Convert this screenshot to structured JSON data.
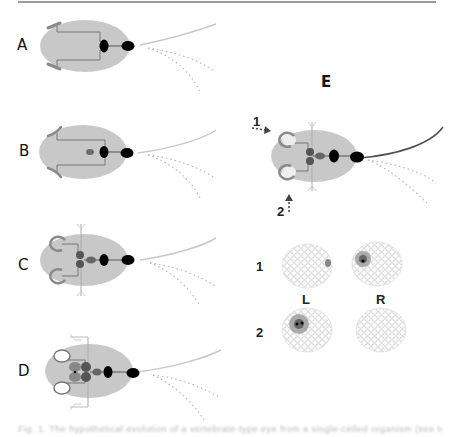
{
  "panels": {
    "A": {
      "label": "A"
    },
    "B": {
      "label": "B"
    },
    "C": {
      "label": "C"
    },
    "D": {
      "label": "D"
    },
    "E": {
      "label": "E",
      "arrow_labels": [
        "1",
        "2"
      ],
      "row_labels": [
        "1",
        "2"
      ],
      "column_labels": [
        "L",
        "R"
      ]
    }
  },
  "colors": {
    "cell_body": "#c8c8c8",
    "eyespot": "#000000",
    "flagellum_light": "#c8c8c8",
    "flagellum_dark": "#505050",
    "channel_gray": "#8a8a8a",
    "rule": "#9a9a9a"
  },
  "caption": {
    "text": "Fig. 1. The hypothetical evolution of a vertebrate-type eye from a single-celled organism (see text)"
  }
}
